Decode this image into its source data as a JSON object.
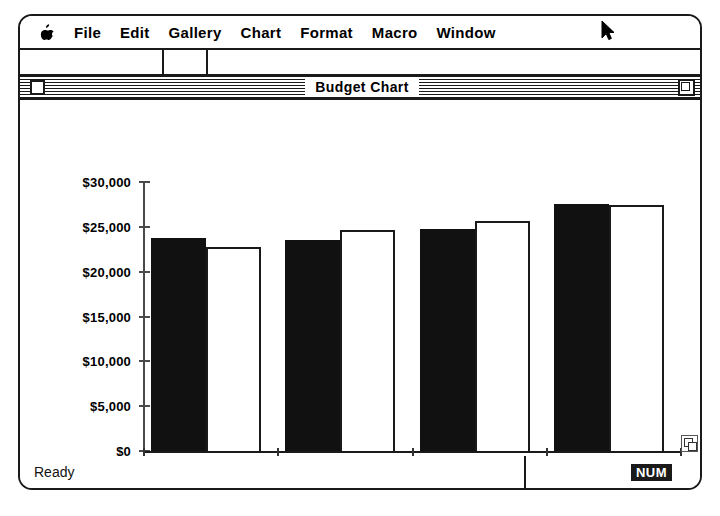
{
  "menubar": {
    "apple_icon": "apple-icon",
    "items": [
      {
        "label": "File"
      },
      {
        "label": "Edit"
      },
      {
        "label": "Gallery"
      },
      {
        "label": "Chart"
      },
      {
        "label": "Format"
      },
      {
        "label": "Macro"
      },
      {
        "label": "Window"
      }
    ],
    "cursor_icon": "mouse-pointer-icon"
  },
  "window": {
    "title": "Budget Chart",
    "close_box_icon": "close-box-icon",
    "zoom_box_icon": "zoom-box-icon",
    "grow_box_icon": "grow-box-icon"
  },
  "statusbar": {
    "message": "Ready",
    "num_lock": "NUM"
  },
  "chart_data": {
    "type": "bar",
    "title": "Budget Chart",
    "xlabel": "",
    "ylabel": "",
    "categories": [
      "1st Qtr",
      "2nd Qtr",
      "3rd Qtr",
      "4th Qtr"
    ],
    "series": [
      {
        "name": "Series 1",
        "color": "#111111",
        "values": [
          23800,
          23500,
          24800,
          27500
        ]
      },
      {
        "name": "Series 2",
        "color": "#ffffff",
        "values": [
          22800,
          24700,
          25700,
          27400
        ]
      }
    ],
    "ylim": [
      0,
      30000
    ],
    "ytick_values": [
      0,
      5000,
      10000,
      15000,
      20000,
      25000,
      30000
    ],
    "ytick_labels": [
      "$0",
      "$5,000",
      "$10,000",
      "$15,000",
      "$20,000",
      "$25,000",
      "$30,000"
    ],
    "grid": false,
    "legend": "none"
  }
}
